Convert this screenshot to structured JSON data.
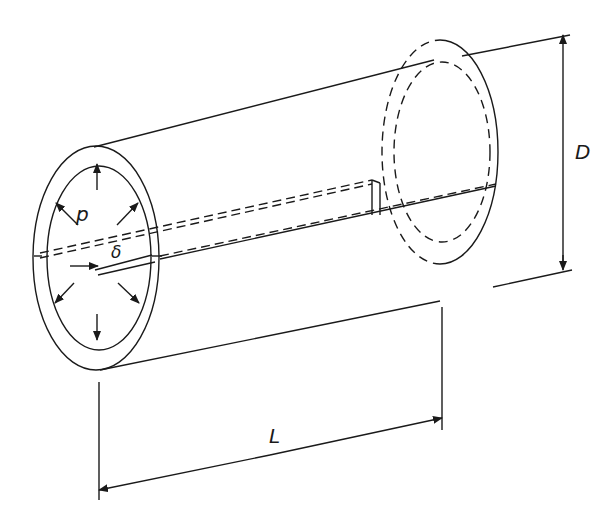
{
  "figure": {
    "labels": {
      "pressure": "p",
      "thickness": "δ",
      "diameter": "D",
      "length": "L"
    },
    "colors": {
      "line": "#1a1a1a",
      "background": "#ffffff"
    }
  }
}
